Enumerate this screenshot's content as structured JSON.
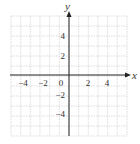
{
  "figure": {
    "type": "coordinate-grid",
    "x_axis_label": "x",
    "y_axis_label": "y",
    "x_range": [
      -6,
      6
    ],
    "y_range": [
      -6,
      6
    ],
    "grid_step": 1,
    "x_tick_labels": [
      "−4",
      "−2",
      "0",
      "2",
      "4"
    ],
    "x_tick_values": [
      -4,
      -2,
      0,
      2,
      4
    ],
    "y_tick_labels": [
      "4",
      "2",
      "−2",
      "−4"
    ],
    "y_tick_values": [
      4,
      2,
      -2,
      -4
    ],
    "colors": {
      "grid": "#c8c8c8",
      "axis": "#222222",
      "label": "#333333",
      "background": "#ffffff"
    }
  }
}
